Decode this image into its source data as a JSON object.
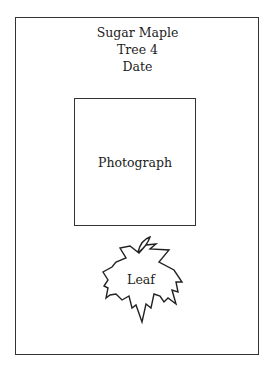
{
  "card": {
    "species": "Sugar Maple",
    "tree": "Tree 4",
    "date": "Date"
  },
  "photo": {
    "label": "Photograph"
  },
  "leaf": {
    "label": "Leaf",
    "icon": "maple-leaf-icon"
  }
}
